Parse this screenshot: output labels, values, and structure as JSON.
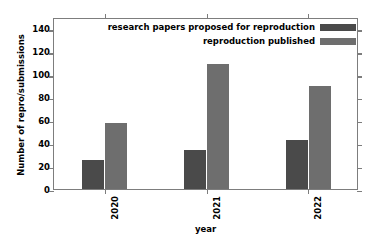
{
  "chart_data": {
    "type": "bar",
    "title": "",
    "xlabel": "year",
    "ylabel": "Number of repro/submissions",
    "categories": [
      "2020",
      "2021",
      "2022"
    ],
    "series": [
      {
        "name": "research papers proposed for reproduction",
        "color": "#4a4a4a",
        "values": [
          25,
          34,
          43
        ]
      },
      {
        "name": "reproduction published",
        "color": "#6e6e6e",
        "values": [
          58,
          109,
          90
        ]
      }
    ],
    "ylim": [
      0,
      150
    ],
    "yticks": [
      0,
      20,
      40,
      60,
      80,
      100,
      120,
      140
    ],
    "ytick_labels": [
      "0",
      "20",
      "40",
      "60",
      "80",
      "100",
      "120",
      "140"
    ],
    "grid": false,
    "legend_position": "top-right",
    "xtick_rotation": 90,
    "frame": true
  },
  "legend": {
    "entries": [
      {
        "label": "research papers proposed for reproduction",
        "swatch": "#4a4a4a"
      },
      {
        "label": "reproduction published",
        "swatch": "#6e6e6e"
      }
    ]
  },
  "axes": {
    "x_title": "year",
    "y_title": "Number of repro/submissions"
  },
  "colors": {
    "series_dark": "#4a4a4a",
    "series_light": "#6e6e6e",
    "frame": "#7d7d7d",
    "background": "#ffffff",
    "text": "#000000"
  }
}
